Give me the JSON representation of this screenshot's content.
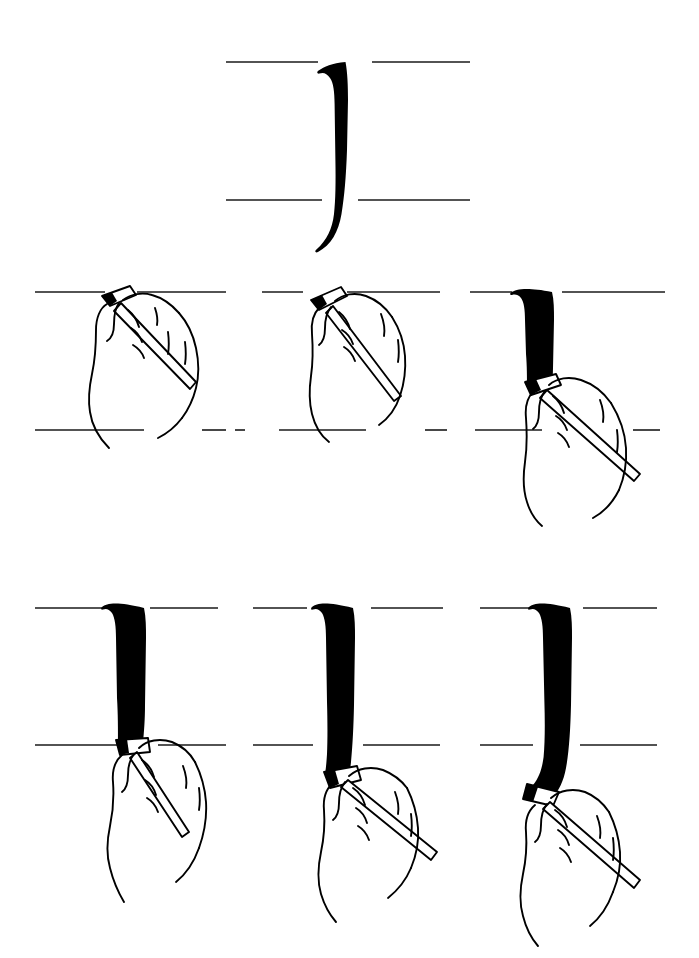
{
  "figure": {
    "ink_color": "#000000",
    "paper_color": "#ffffff",
    "guideline_color": "#1a1a1a",
    "outline_color": "#000000"
  },
  "hero": {
    "name": "finished-stroke",
    "caption": "Completed calligraphic descending stroke with hooked tail",
    "guidelines": {
      "ascender_line_y": 62,
      "baseline_y": 200,
      "x_height_px": 138
    },
    "stroke": {
      "top_y": 62,
      "bottom_y": 252,
      "width_px": 26,
      "entry": "angled flat serif with concave left notch",
      "exit": "tapered hook curving left below baseline"
    }
  },
  "steps": [
    {
      "index": 1,
      "name": "step-1-pen-placed-at-top-line",
      "caption": "Pen nib set on the ascender line, hand relaxed, shaft angled down-right",
      "stroke_progress_pct": 0,
      "nib_at_y_pct": 0,
      "ink_drawn": false
    },
    {
      "index": 2,
      "name": "step-2-pen-angle-established",
      "caption": "Nib edge rotated to the writing angle, still at the top line",
      "stroke_progress_pct": 0,
      "nib_at_y_pct": 0,
      "ink_drawn": false
    },
    {
      "index": 3,
      "name": "step-3-stroke-pulled-partway-down",
      "caption": "Stroke pulled straight down about two-thirds of the x-height",
      "stroke_progress_pct": 60,
      "nib_at_y_pct": 60,
      "ink_drawn": true
    },
    {
      "index": 4,
      "name": "step-4-stroke-reaches-baseline",
      "caption": "Stroke continued until the nib rests on the baseline",
      "stroke_progress_pct": 100,
      "nib_at_y_pct": 100,
      "ink_drawn": true
    },
    {
      "index": 5,
      "name": "step-5-stroke-passes-below-baseline",
      "caption": "Stroke carried below the baseline as the curve begins",
      "stroke_progress_pct": 125,
      "nib_at_y_pct": 125,
      "ink_drawn": true
    },
    {
      "index": 6,
      "name": "step-6-tail-curved-left",
      "caption": "Nib swept left to finish the tapered hook of the tail",
      "stroke_progress_pct": 145,
      "nib_at_y_pct": 145,
      "ink_drawn": true
    }
  ],
  "layout": {
    "rows": 3,
    "columns_per_demo_row": 3,
    "row2_ascender_line_y": 292,
    "row2_baseline_y": 430,
    "row3_ascender_line_y": 608,
    "row3_baseline_y": 745
  }
}
